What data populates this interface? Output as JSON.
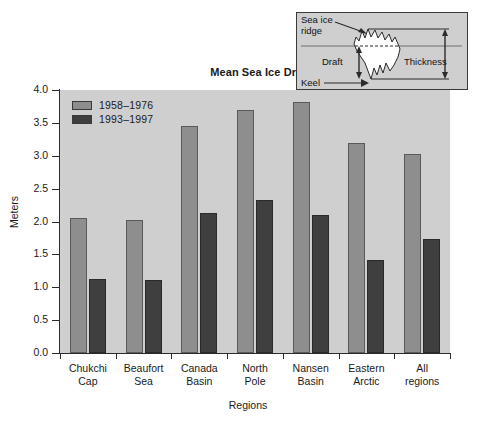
{
  "chart_data": {
    "type": "bar",
    "title": "Mean Sea Ice Draft",
    "xlabel": "Regions",
    "ylabel": "Meters",
    "ylim": [
      0.0,
      4.0
    ],
    "ytick_labels": [
      "0.0",
      "0.5",
      "1.0",
      "1.5",
      "2.0",
      "2.5",
      "3.0",
      "3.5",
      "4.0"
    ],
    "ytick_values": [
      0.0,
      0.5,
      1.0,
      1.5,
      2.0,
      2.5,
      3.0,
      3.5,
      4.0
    ],
    "grid": false,
    "legend_position": "top-left-inside",
    "categories": [
      "Chukchi Cap",
      "Beaufort Sea",
      "Canada Basin",
      "North Pole",
      "Nansen Basin",
      "Eastern Arctic",
      "All regions"
    ],
    "category_lines": [
      [
        "Chukchi",
        "Cap"
      ],
      [
        "Beaufort",
        "Sea"
      ],
      [
        "Canada",
        "Basin"
      ],
      [
        "North",
        "Pole"
      ],
      [
        "Nansen",
        "Basin"
      ],
      [
        "Eastern",
        "Arctic"
      ],
      [
        "All",
        "regions"
      ]
    ],
    "series": [
      {
        "name": "1958–1976",
        "color": "#8e8e8e",
        "values": [
          2.05,
          2.03,
          3.45,
          3.7,
          3.82,
          3.2,
          3.02
        ]
      },
      {
        "name": "1993–1997",
        "color": "#3f3f3f",
        "values": [
          1.12,
          1.11,
          2.13,
          2.33,
          2.1,
          1.41,
          1.73
        ]
      }
    ]
  },
  "inset": {
    "label_sea_ice_ridge_line1": "Sea ice",
    "label_sea_ice_ridge_line2": "ridge",
    "label_draft": "Draft",
    "label_thickness": "Thickness",
    "label_keel": "Keel",
    "background_color": "#cfcfcf",
    "ice_color": "#ffffff"
  },
  "colors": {
    "plot_background": "#cfcfcf",
    "axis": "#2b2b2b",
    "series_1958_1976": "#8e8e8e",
    "series_1993_1997": "#3f3f3f",
    "page_background": "#ffffff"
  }
}
